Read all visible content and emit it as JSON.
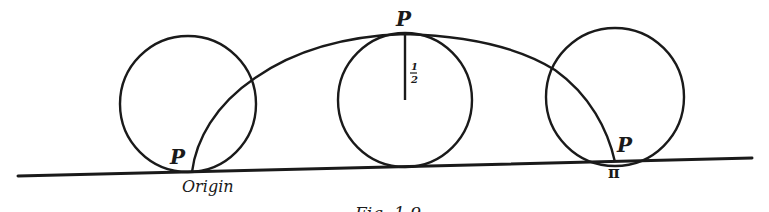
{
  "figure": {
    "caption": "Fig. 1.9",
    "stroke_color": "#1a1a1a",
    "background": "#ffffff",
    "labels": {
      "point_left": "P",
      "point_top": "P",
      "point_right": "P",
      "origin": "Origin",
      "pi": "π",
      "radius_num": "1",
      "radius_den": "2"
    },
    "circles": [
      {
        "name": "rolling-circle-start",
        "cx": 188,
        "cy": 104,
        "r": 68
      },
      {
        "name": "rolling-circle-middle",
        "cx": 405,
        "cy": 100,
        "r": 67
      },
      {
        "name": "rolling-circle-end",
        "cx": 615,
        "cy": 97,
        "r": 69
      }
    ],
    "radius_value": "1/2",
    "curve": "cycloid arch traced by point P from origin to π"
  }
}
